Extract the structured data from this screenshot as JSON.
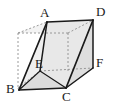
{
  "figure": {
    "type": "geometry-diagram",
    "canvas": {
      "width": 113,
      "height": 106
    },
    "colors": {
      "background": "#ffffff",
      "solid_edge": "#1a1a1a",
      "hidden_edge": "#8e8e8e",
      "face_light": "#f0f0f0",
      "face_mid": "#e4e4e4",
      "face_shade": "#d8d8d8",
      "label_text": "#1a1a1a"
    },
    "vertices": [
      {
        "id": "A",
        "label": "A",
        "x": 47,
        "y": 22,
        "label_x": 40,
        "label_y": 6,
        "hidden": false
      },
      {
        "id": "D",
        "label": "D",
        "x": 93,
        "y": 20,
        "label_x": 96,
        "label_y": 5,
        "hidden": false
      },
      {
        "id": "B",
        "label": "B",
        "x": 19,
        "y": 90,
        "label_x": 7,
        "label_y": 83,
        "hidden": false
      },
      {
        "id": "C",
        "label": "C",
        "x": 66,
        "y": 88,
        "label_x": 62,
        "label_y": 91,
        "hidden": false
      },
      {
        "id": "E",
        "label": "E",
        "x": 40,
        "y": 71,
        "label_x": 35,
        "label_y": 58,
        "hidden": false
      },
      {
        "id": "F",
        "label": "F",
        "x": 93,
        "y": 68,
        "label_x": 96,
        "label_y": 57,
        "hidden": false
      }
    ],
    "hidden_vertices": [
      {
        "id": "G",
        "x": 18,
        "y": 33
      },
      {
        "id": "H",
        "x": 68,
        "y": 33
      },
      {
        "id": "I",
        "x": 18,
        "y": 88
      }
    ],
    "solid_edges": [
      {
        "from": "A",
        "to": "D"
      },
      {
        "from": "A",
        "to": "B"
      },
      {
        "from": "A",
        "to": "E"
      },
      {
        "from": "E",
        "to": "B"
      },
      {
        "from": "B",
        "to": "C"
      },
      {
        "from": "C",
        "to": "D"
      },
      {
        "from": "C",
        "to": "F"
      },
      {
        "from": "D",
        "to": "F"
      },
      {
        "from": "E",
        "to": "C"
      }
    ],
    "hidden_edges": [
      {
        "from": "G",
        "to": "H"
      },
      {
        "from": "G",
        "to": "A"
      },
      {
        "from": "G",
        "to": "I"
      },
      {
        "from": "I",
        "to": "B"
      },
      {
        "from": "H",
        "to": "D"
      },
      {
        "from": "H",
        "to": "E"
      },
      {
        "from": "E",
        "to": "F"
      },
      {
        "from": "I",
        "to": "E"
      }
    ],
    "labels": {
      "A": "A",
      "B": "B",
      "C": "C",
      "D": "D",
      "E": "E",
      "F": "F"
    }
  }
}
